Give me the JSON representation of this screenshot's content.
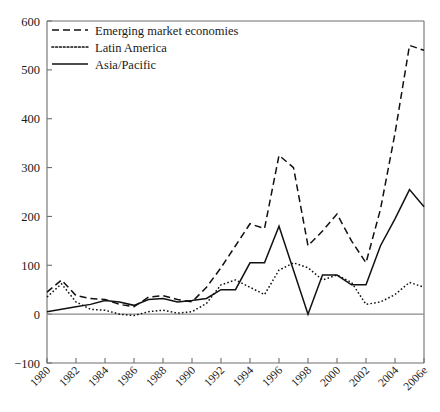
{
  "chart_data": {
    "type": "line",
    "title": "",
    "xlabel": "",
    "ylabel": "",
    "grid": false,
    "legend_position": "top-left",
    "ylim": [
      -100,
      600
    ],
    "yticks": [
      -100,
      0,
      100,
      200,
      300,
      400,
      500,
      600
    ],
    "xlim": [
      1980,
      2006
    ],
    "xticks": [
      1980,
      1982,
      1984,
      1986,
      1988,
      1990,
      1992,
      1994,
      1996,
      1998,
      2000,
      2002,
      2004,
      2006
    ],
    "xtick_labels": [
      "1980",
      "1982",
      "1984",
      "1986",
      "1988",
      "1990",
      "1992",
      "1994",
      "1996",
      "1998",
      "2000",
      "2002",
      "2004",
      "2006e"
    ],
    "x": [
      1980,
      1981,
      1982,
      1983,
      1984,
      1985,
      1986,
      1987,
      1988,
      1989,
      1990,
      1991,
      1992,
      1993,
      1994,
      1995,
      1996,
      1997,
      1998,
      1999,
      2000,
      2001,
      2002,
      2003,
      2004,
      2005,
      2006
    ],
    "series": [
      {
        "name": "Emerging market economies",
        "style": "dashed",
        "values": [
          45,
          70,
          38,
          32,
          30,
          20,
          15,
          35,
          38,
          30,
          25,
          55,
          95,
          140,
          185,
          175,
          325,
          300,
          140,
          170,
          205,
          150,
          105,
          215,
          370,
          550,
          540
        ]
      },
      {
        "name": "Latin America",
        "style": "dotted",
        "values": [
          35,
          62,
          25,
          10,
          8,
          0,
          -3,
          5,
          8,
          2,
          5,
          22,
          60,
          70,
          55,
          40,
          90,
          105,
          95,
          70,
          80,
          65,
          20,
          25,
          40,
          65,
          55
        ]
      },
      {
        "name": "Asia/Pacific",
        "style": "solid",
        "values": [
          5,
          10,
          15,
          20,
          28,
          25,
          18,
          30,
          32,
          25,
          28,
          32,
          50,
          50,
          105,
          105,
          180,
          90,
          0,
          80,
          80,
          60,
          60,
          140,
          195,
          255,
          220
        ]
      }
    ]
  },
  "legend": {
    "items": [
      {
        "label": "Emerging market economies",
        "style": "dashed"
      },
      {
        "label": "Latin America",
        "style": "dotted"
      },
      {
        "label": "Asia/Pacific",
        "style": "solid"
      }
    ]
  }
}
